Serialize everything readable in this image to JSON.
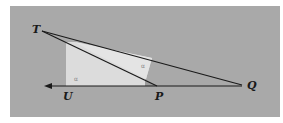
{
  "diagram": {
    "type": "geometry-figure",
    "colors": {
      "background": "#a9a9a9",
      "light_region": "#dcdcdc",
      "dark_wedge": "#9a9a9a",
      "line": "#1a1a1a"
    },
    "points": [
      {
        "id": "T",
        "label": "T",
        "x": 42,
        "y": 31
      },
      {
        "id": "U",
        "label": "U",
        "x": 67,
        "y": 86
      },
      {
        "id": "P",
        "label": "P",
        "x": 157,
        "y": 86
      },
      {
        "id": "Q",
        "label": "Q",
        "x": 242,
        "y": 85
      }
    ],
    "segments": [
      {
        "from": "T",
        "to": "Q"
      },
      {
        "from": "T",
        "to": "P"
      },
      {
        "from": "Q",
        "to": "U",
        "arrow_end": "left"
      }
    ],
    "angle_marks": [
      {
        "label": "α",
        "near": "U",
        "x": 76,
        "y": 80
      },
      {
        "label": "α",
        "near": "TQ",
        "x": 143,
        "y": 67
      }
    ]
  }
}
